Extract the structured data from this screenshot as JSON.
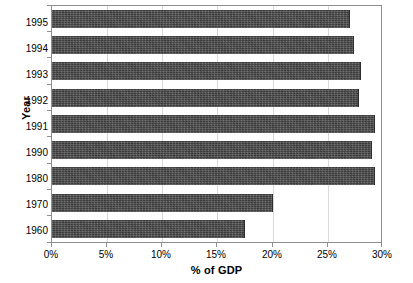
{
  "chart_data": {
    "type": "bar",
    "orientation": "horizontal",
    "title": "",
    "xlabel": "% of GDP",
    "ylabel": "Year",
    "categories": [
      "1995",
      "1994",
      "1993",
      "1992",
      "1991",
      "1990",
      "1980",
      "1970",
      "1960"
    ],
    "values": [
      27.0,
      27.4,
      28.0,
      27.8,
      29.3,
      29.0,
      29.3,
      20.0,
      17.5
    ],
    "xlim": [
      0,
      30
    ],
    "xticks": [
      0,
      5,
      10,
      15,
      20,
      25,
      30
    ],
    "xtick_labels": [
      "0%",
      "5%",
      "10%",
      "15%",
      "20%",
      "25%",
      "30%"
    ],
    "grid": true,
    "legend": "none",
    "bar_color": "#4a4a4a",
    "frame_color": "#8e8e8e",
    "gridline_color": "#d9d9d9"
  }
}
